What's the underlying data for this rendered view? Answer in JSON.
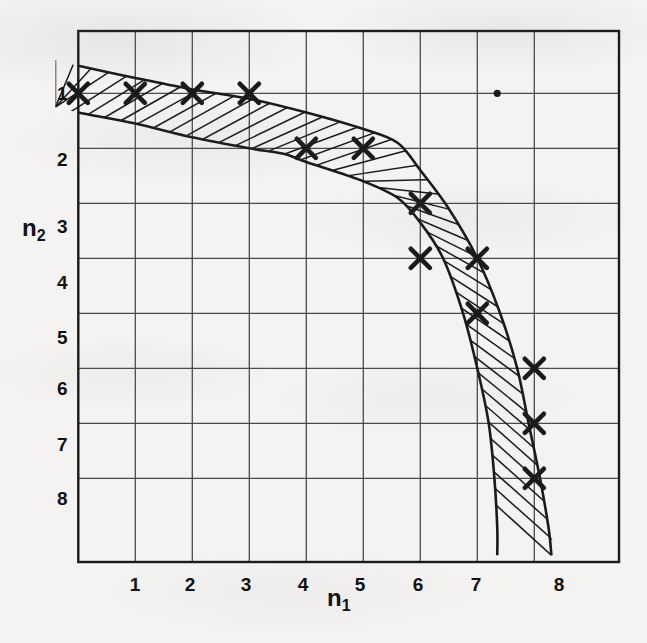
{
  "figure": {
    "background_color": "#f4f3f1",
    "ink_color": "#1a1a1a",
    "grid_color": "#4a4a4a",
    "caption": ""
  },
  "axes": {
    "x_title": "n",
    "x_title_sub": "1",
    "y_title": "n",
    "y_title_sub": "2",
    "x_ticks": [
      "1",
      "2",
      "3",
      "4",
      "5",
      "6",
      "7",
      "8"
    ],
    "y_ticks": [
      "1",
      "2",
      "3",
      "4",
      "5",
      "6",
      "7",
      "8"
    ],
    "x_direction": "increasing-right",
    "y_direction": "increasing-downward",
    "grid": true
  },
  "chart_data": {
    "type": "scatter",
    "title": "",
    "xlabel": "n1",
    "ylabel": "n2",
    "xlim": [
      -0.4,
      9.65
    ],
    "ylim": [
      -0.55,
      9.6
    ],
    "y_axis_inverted": true,
    "grid": true,
    "legend": null,
    "x_ticks": [
      1,
      2,
      3,
      4,
      5,
      6,
      7,
      8
    ],
    "y_ticks": [
      1,
      2,
      3,
      4,
      5,
      6,
      7,
      8
    ],
    "series": [
      {
        "name": "marked points",
        "marker": "x",
        "x": [
          0,
          1,
          2,
          3,
          4,
          5,
          6,
          6,
          7,
          7,
          8,
          8,
          8
        ],
        "y": [
          1,
          1,
          1,
          1,
          2,
          2,
          3,
          4,
          4,
          5,
          6,
          7,
          8
        ]
      },
      {
        "name": "stray dot",
        "marker": "dot",
        "x": [
          7.35
        ],
        "y": [
          1.0
        ]
      }
    ],
    "band": {
      "name": "hatched boundary band",
      "fill": "diagonal-hatch",
      "upper_edge": {
        "x": [
          -0.4,
          0,
          1,
          2,
          3,
          4,
          5,
          5.6,
          6,
          6.5,
          7,
          7.4,
          7.7,
          7.9,
          8.1,
          8.25,
          8.3
        ],
        "y": [
          0.4,
          0.5,
          0.72,
          0.93,
          1.1,
          1.35,
          1.65,
          1.9,
          2.4,
          3.1,
          4.0,
          5.0,
          6.0,
          7.0,
          8.0,
          8.9,
          9.4
        ]
      },
      "lower_edge": {
        "x": [
          -0.4,
          0,
          1,
          2,
          3,
          3.6,
          4,
          5,
          5.6,
          6,
          6.4,
          6.75,
          7.0,
          7.2,
          7.3,
          7.35,
          7.35
        ],
        "y": [
          1.25,
          1.35,
          1.55,
          1.8,
          2.0,
          2.1,
          2.25,
          2.6,
          2.9,
          3.35,
          4.0,
          5.0,
          6.0,
          7.0,
          8.0,
          8.9,
          9.4
        ]
      }
    }
  }
}
